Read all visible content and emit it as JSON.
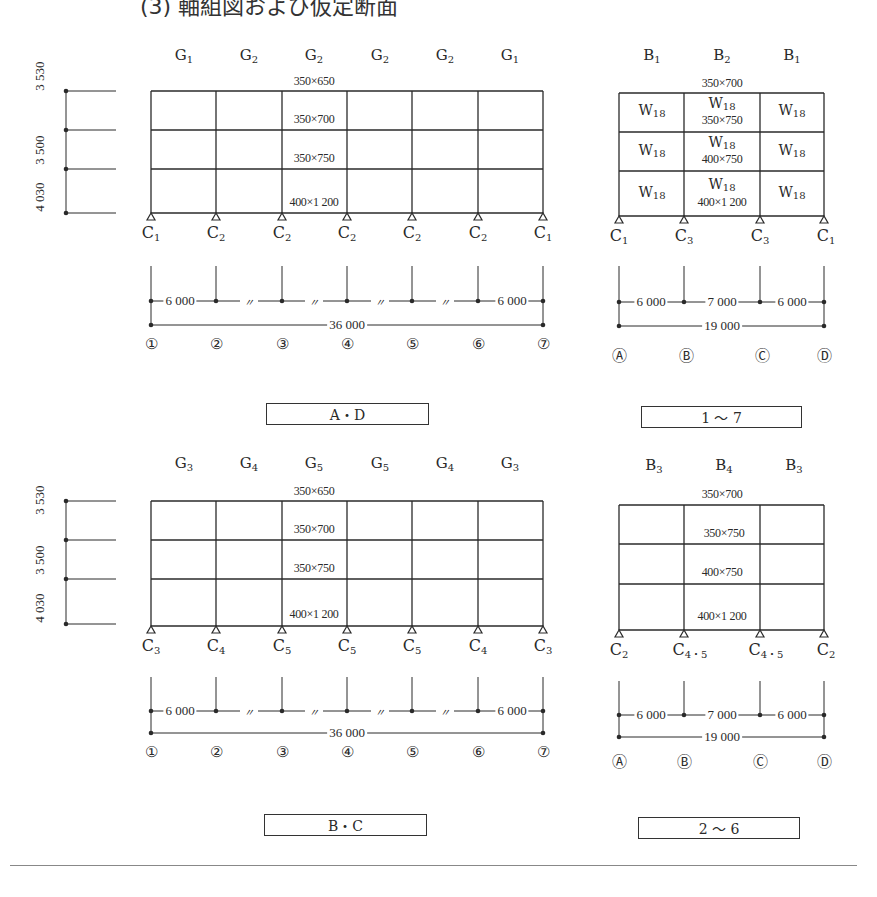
{
  "title": "(3) 軸組図および仮定断面",
  "frames": [
    {
      "id": "frame-AD",
      "caption": "A・D",
      "members": [
        "G1",
        "G2",
        "G2",
        "G2",
        "G2",
        "G1"
      ],
      "columns": [
        "C1",
        "C2",
        "C2",
        "C2",
        "C2",
        "C2",
        "C1"
      ],
      "sections": {
        "roof": "350×650",
        "f3": "350×700",
        "f2": "350×750",
        "f1": "400×1 200"
      },
      "storeys": [
        "3 530",
        "3 500",
        "4 030"
      ],
      "spans": [
        "6 000",
        "〃",
        "〃",
        "〃",
        "〃",
        "6 000"
      ],
      "total": "36 000",
      "axes": [
        "①",
        "②",
        "③",
        "④",
        "⑤",
        "⑥",
        "⑦"
      ]
    },
    {
      "id": "frame-1-7",
      "caption": "1 ～ 7",
      "members": [
        "B1",
        "B2",
        "B1"
      ],
      "columns": [
        "C1",
        "C3",
        "C3",
        "C1"
      ],
      "sections": {
        "roof": "350×700",
        "f3": "350×750",
        "f2": "400×750",
        "f1": "400×1 200"
      },
      "wall": "W18",
      "spans": [
        "6 000",
        "7 000",
        "6 000"
      ],
      "total": "19 000",
      "axes": [
        "Ⓐ",
        "Ⓑ",
        "Ⓒ",
        "Ⓓ"
      ]
    },
    {
      "id": "frame-BC",
      "caption": "B・C",
      "members": [
        "G3",
        "G4",
        "G5",
        "G5",
        "G4",
        "G3"
      ],
      "columns": [
        "C3",
        "C4",
        "C5",
        "C5",
        "C5",
        "C4",
        "C3"
      ],
      "sections": {
        "roof": "350×650",
        "f3": "350×700",
        "f2": "350×750",
        "f1": "400×1 200"
      },
      "storeys": [
        "3 530",
        "3 500",
        "4 030"
      ],
      "spans": [
        "6 000",
        "〃",
        "〃",
        "〃",
        "〃",
        "6 000"
      ],
      "total": "36 000",
      "axes": [
        "①",
        "②",
        "③",
        "④",
        "⑤",
        "⑥",
        "⑦"
      ]
    },
    {
      "id": "frame-2-6",
      "caption": "2 ～ 6",
      "members": [
        "B3",
        "B4",
        "B3"
      ],
      "columns": [
        "C2",
        "C4・5",
        "C4・5",
        "C2"
      ],
      "sections": {
        "roof": "350×700",
        "f3": "350×750",
        "f2": "400×750",
        "f1": "400×1 200"
      },
      "spans": [
        "6 000",
        "7 000",
        "6 000"
      ],
      "total": "19 000",
      "axes": [
        "Ⓐ",
        "Ⓑ",
        "Ⓒ",
        "Ⓓ"
      ]
    }
  ],
  "colors": {
    "line": "#2a2a2a",
    "background": "#ffffff",
    "rule": "#888888"
  }
}
